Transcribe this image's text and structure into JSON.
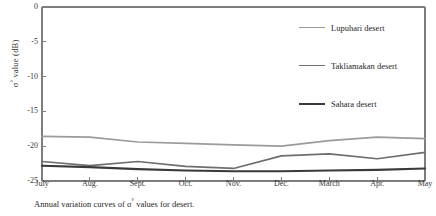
{
  "figure": {
    "caption_prefix": "Annual variation curves of ",
    "caption_symbol": "σ",
    "caption_sup": "°",
    "caption_suffix": "  values for  desert.",
    "caption_full": "Annual variation curves of σ° values for desert."
  },
  "axes": {
    "y_title_symbol": "σ",
    "y_title_sup": "°",
    "y_title_rest": " value (dB)",
    "y_title_full": "σ° value (dB)",
    "x_title": ""
  },
  "legend": {
    "position": "upper-right-inside",
    "entries": [
      {
        "label": "Lupuhari desert",
        "color": "#9b9b9b",
        "width": 1.8
      },
      {
        "label": "Takliamakan desert",
        "color": "#6e6e6e",
        "width": 1.8
      },
      {
        "label": "Sahara desert",
        "color": "#3a3a3a",
        "width": 2.2
      }
    ]
  },
  "chart_data": {
    "type": "line",
    "title": "",
    "subtitle": "",
    "xlabel": "",
    "ylabel": "σ° value (dB)",
    "categories": [
      "July",
      "Aug.",
      "Sept.",
      "Oct.",
      "Nov.",
      "Dec.",
      "March",
      "Apr.",
      "May"
    ],
    "x_tick_labels": [
      "July",
      "Aug.",
      "Sept.",
      "Oct.",
      "Nov.",
      "Dec.",
      "March",
      "Apr.",
      "May"
    ],
    "y_tick_labels": [
      "0",
      "-5",
      "-10",
      "-15",
      "-20",
      "-25"
    ],
    "y_ticks": [
      0,
      -5,
      -10,
      -15,
      -20,
      -25
    ],
    "ylim": [
      -25,
      0
    ],
    "xlim": [
      0,
      8
    ],
    "grid": false,
    "series": [
      {
        "name": "Lupuhari desert",
        "color": "#9b9b9b",
        "values": [
          -18.6,
          -18.7,
          -19.4,
          -19.6,
          -19.8,
          -20.0,
          -19.2,
          -18.7,
          -18.9
        ]
      },
      {
        "name": "Takliamakan desert",
        "color": "#6e6e6e",
        "values": [
          -22.2,
          -22.8,
          -22.2,
          -22.9,
          -23.2,
          -21.4,
          -21.1,
          -21.8,
          -20.9
        ]
      },
      {
        "name": "Sahara desert",
        "color": "#3a3a3a",
        "values": [
          -22.8,
          -23.0,
          -23.3,
          -23.5,
          -23.6,
          -23.6,
          -23.5,
          -23.4,
          -23.2
        ]
      }
    ]
  },
  "plot_box": {
    "left": 42,
    "right": 425,
    "top": 7,
    "bottom": 181,
    "border_color": "#7d7d7d"
  }
}
